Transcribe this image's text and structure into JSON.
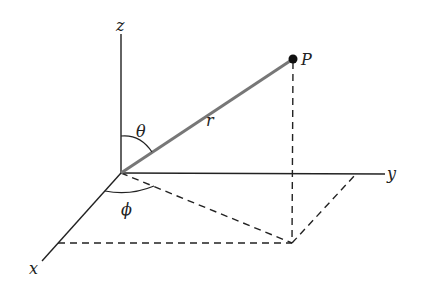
{
  "diagram": {
    "labels": {
      "z_axis": "z",
      "y_axis": "y",
      "x_axis": "x",
      "point": "P",
      "radius": "r",
      "polar_angle": "θ",
      "azimuth_angle": "ϕ"
    },
    "colors": {
      "axes": "#222222",
      "radius_line": "#777777",
      "dashed": "#222222",
      "point": "#111111"
    }
  }
}
